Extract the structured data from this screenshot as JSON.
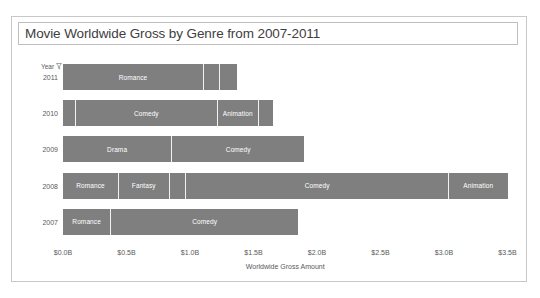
{
  "chart": {
    "title": "Movie Worldwide Gross by Genre from 2007-2011",
    "legend_label": "Year",
    "filter_icon": "filter-icon"
  },
  "chart_data": {
    "type": "bar",
    "orientation": "horizontal",
    "stacked": true,
    "title": "Movie Worldwide Gross by Genre from 2007-2011",
    "xlabel": "Worldwide Gross Amount",
    "ylabel": "Year",
    "grid": false,
    "legend": "none",
    "xlim": [
      0,
      3.75
    ],
    "xtick_values": [
      0,
      0.5,
      1.0,
      1.5,
      2.0,
      2.5,
      3.0,
      3.5
    ],
    "xtick_labels": [
      "$0.0B",
      "$0.5B",
      "$1.0B",
      "$1.5B",
      "$2.0B",
      "$2.5B",
      "$3.0B",
      "$3.5B"
    ],
    "categories": [
      "2011",
      "2010",
      "2009",
      "2008",
      "2007"
    ],
    "rows": [
      {
        "year": "2011",
        "total": 1.37,
        "segments": [
          {
            "label": "Romance",
            "value": 1.11
          },
          {
            "label": "",
            "value": 0.13
          },
          {
            "label": "",
            "value": 0.13
          }
        ]
      },
      {
        "year": "2010",
        "total": 1.65,
        "segments": [
          {
            "label": "",
            "value": 0.1
          },
          {
            "label": "Comedy",
            "value": 1.12
          },
          {
            "label": "Animation",
            "value": 0.32
          },
          {
            "label": "",
            "value": 0.11
          }
        ]
      },
      {
        "year": "2009",
        "total": 1.9,
        "segments": [
          {
            "label": "Drama",
            "value": 0.86
          },
          {
            "label": "Comedy",
            "value": 1.04
          }
        ]
      },
      {
        "year": "2008",
        "total": 3.5,
        "segments": [
          {
            "label": "Romance",
            "value": 0.44
          },
          {
            "label": "Fantasy",
            "value": 0.4
          },
          {
            "label": "",
            "value": 0.13
          },
          {
            "label": "Comedy",
            "value": 2.07
          },
          {
            "label": "Animation",
            "value": 0.46
          }
        ]
      },
      {
        "year": "2007",
        "total": 1.85,
        "segments": [
          {
            "label": "Romance",
            "value": 0.38
          },
          {
            "label": "Comedy",
            "value": 1.47
          }
        ]
      }
    ],
    "colors": {
      "bar": "#7f7f7f",
      "divider": "#f2f2f2",
      "text": "#595959",
      "title_text": "#404040",
      "border": "#c8c8c8",
      "background": "#ffffff"
    }
  }
}
